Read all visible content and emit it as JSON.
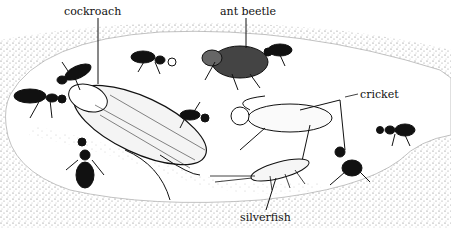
{
  "diagram": {
    "labels": [
      {
        "id": "cockroach",
        "text": "cockroach",
        "x": 64,
        "y": 6
      },
      {
        "id": "ant-beetle",
        "text": "ant beetle",
        "x": 220,
        "y": 6
      },
      {
        "id": "cricket",
        "text": "cricket",
        "x": 360,
        "y": 89
      },
      {
        "id": "silverfish",
        "text": "silverfish",
        "x": 240,
        "y": 212
      }
    ],
    "colors": {
      "ink": "#111111",
      "soil_stipple": "#444444",
      "background": "#ffffff"
    }
  }
}
